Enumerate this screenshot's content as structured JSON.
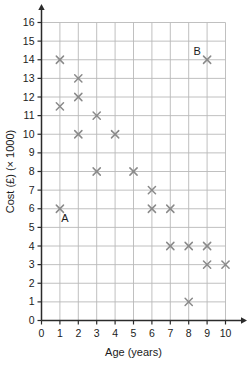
{
  "chart_data": {
    "type": "scatter",
    "title": "",
    "xlabel": "Age (years)",
    "ylabel": "Cost (£) (× 1000)",
    "xlim": [
      0,
      10
    ],
    "ylim": [
      0,
      16
    ],
    "grid": true,
    "legend": "none",
    "xticks": [
      "0",
      "1",
      "2",
      "3",
      "4",
      "5",
      "6",
      "7",
      "8",
      "9",
      "10"
    ],
    "yticks": [
      "0",
      "1",
      "2",
      "3",
      "4",
      "5",
      "6",
      "7",
      "8",
      "9",
      "10",
      "11",
      "12",
      "13",
      "14",
      "15",
      "16"
    ],
    "marker": "x",
    "marker_color": "#8a8a8a",
    "points": [
      {
        "x": 1,
        "y": 14,
        "label": ""
      },
      {
        "x": 1,
        "y": 11.5,
        "label": ""
      },
      {
        "x": 1,
        "y": 6,
        "label": "A"
      },
      {
        "x": 2,
        "y": 13,
        "label": ""
      },
      {
        "x": 2,
        "y": 12,
        "label": ""
      },
      {
        "x": 2,
        "y": 10,
        "label": ""
      },
      {
        "x": 3,
        "y": 11,
        "label": ""
      },
      {
        "x": 3,
        "y": 8,
        "label": ""
      },
      {
        "x": 4,
        "y": 10,
        "label": ""
      },
      {
        "x": 5,
        "y": 8,
        "label": ""
      },
      {
        "x": 6,
        "y": 7,
        "label": ""
      },
      {
        "x": 6,
        "y": 6,
        "label": ""
      },
      {
        "x": 7,
        "y": 6,
        "label": ""
      },
      {
        "x": 7,
        "y": 4,
        "label": ""
      },
      {
        "x": 8,
        "y": 4,
        "label": ""
      },
      {
        "x": 8,
        "y": 1,
        "label": ""
      },
      {
        "x": 9,
        "y": 14,
        "label": "B"
      },
      {
        "x": 9,
        "y": 4,
        "label": ""
      },
      {
        "x": 9,
        "y": 3,
        "label": ""
      },
      {
        "x": 10,
        "y": 3,
        "label": ""
      }
    ],
    "annotations": [
      {
        "text": "A",
        "x": 1,
        "y": 6
      },
      {
        "text": "B",
        "x": 9,
        "y": 14
      }
    ],
    "colors": {
      "grid": "#b9b9b9",
      "axis": "#2b2b2b",
      "marker": "#8a8a8a",
      "text": "#1b1b1b",
      "background": "#ffffff"
    }
  }
}
